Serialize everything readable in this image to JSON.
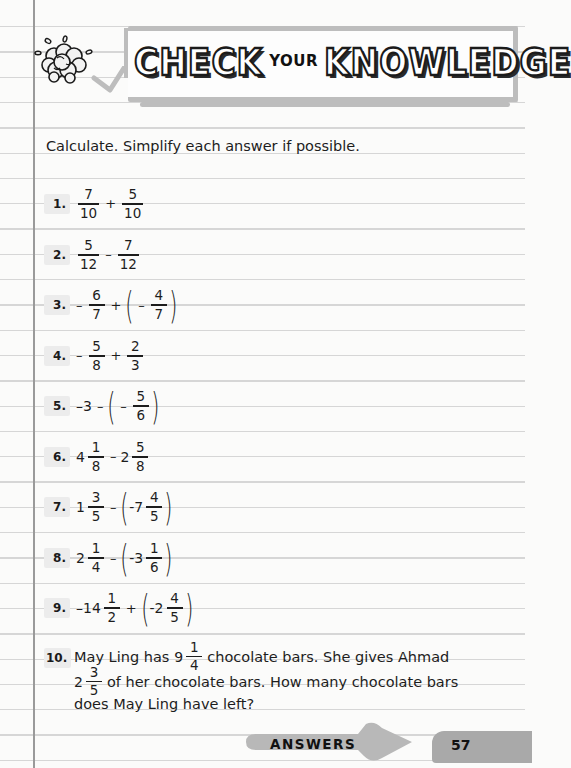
{
  "header": {
    "title_part1": "CHECK",
    "title_part2": "YOUR",
    "title_part3": "KNOWLEDGE",
    "icon": "brain-icon"
  },
  "instructions": "Calculate. Simplify each answer if possible.",
  "problems": [
    {
      "number": "1.",
      "expression": "7/10 + 5/10",
      "parts": {
        "f1n": "7",
        "f1d": "10",
        "op": "+",
        "f2n": "5",
        "f2d": "10"
      }
    },
    {
      "number": "2.",
      "expression": "5/12 − 7/12",
      "parts": {
        "f1n": "5",
        "f1d": "12",
        "op": "–",
        "f2n": "7",
        "f2d": "12"
      }
    },
    {
      "number": "3.",
      "expression": "−6/7 + (−4/7)",
      "parts": {
        "s1": "–",
        "f1n": "6",
        "f1d": "7",
        "op": "+",
        "s2": "–",
        "f2n": "4",
        "f2d": "7"
      }
    },
    {
      "number": "4.",
      "expression": "−5/8 + 2/3",
      "parts": {
        "s1": "–",
        "f1n": "5",
        "f1d": "8",
        "op": "+",
        "f2n": "2",
        "f2d": "3"
      }
    },
    {
      "number": "5.",
      "expression": "−3 − (−5/6)",
      "parts": {
        "w1": "–3",
        "op": "–",
        "s2": "–",
        "f2n": "5",
        "f2d": "6"
      }
    },
    {
      "number": "6.",
      "expression": "4 1/8 − 2 5/8",
      "parts": {
        "w1": "4",
        "f1n": "1",
        "f1d": "8",
        "op": "–",
        "w2": "2",
        "f2n": "5",
        "f2d": "8"
      }
    },
    {
      "number": "7.",
      "expression": "1 3/5 − (−7 4/5)",
      "parts": {
        "w1": "1",
        "f1n": "3",
        "f1d": "5",
        "op": "–",
        "w2": "-7",
        "f2n": "4",
        "f2d": "5"
      }
    },
    {
      "number": "8.",
      "expression": "2 1/4 − (−3 1/6)",
      "parts": {
        "w1": "2",
        "f1n": "1",
        "f1d": "4",
        "op": "–",
        "w2": "-3",
        "f2n": "1",
        "f2d": "6"
      }
    },
    {
      "number": "9.",
      "expression": "−14 1/2 + (−2 4/5)",
      "parts": {
        "w1": "–14",
        "f1n": "1",
        "f1d": "2",
        "op": "+",
        "w2": "-2",
        "f2n": "4",
        "f2d": "5"
      }
    }
  ],
  "word_problem": {
    "number": "10.",
    "line1_a": "May Ling has",
    "line1_whole": "9",
    "line1_fn": "1",
    "line1_fd": "4",
    "line1_b": "chocolate bars. She gives Ahmad",
    "line2_whole": "2",
    "line2_fn": "3",
    "line2_fd": "5",
    "line2_b": "of her chocolate bars. How many chocolate bars",
    "line3": "does May Ling have left?"
  },
  "footer": {
    "answers_label": "ANSWERS",
    "page_number": "57"
  },
  "colors": {
    "paper": "#fbfbfa",
    "rule_line": "#d6d6d6",
    "margin_line": "#9a9a9a",
    "banner_frame": "#bdbdbd",
    "number_badge": "#ececec",
    "footer_arrow": "#b8b8b8"
  }
}
